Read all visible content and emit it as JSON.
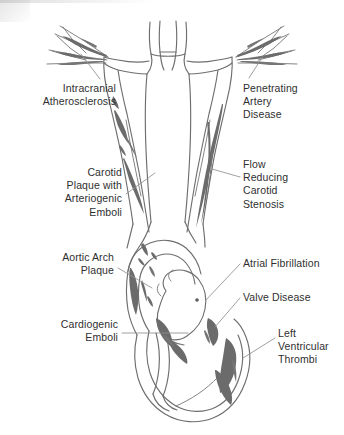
{
  "figure": {
    "background_color": "#ffffff",
    "outline_color": "#6e6e6e",
    "shading_color": "#6b6b6b",
    "leader_line_color": "#8a8a8a",
    "text_color": "#2f2f2f",
    "width": 344,
    "height": 435
  },
  "labels": [
    {
      "id": "intracranial-atherosclerosis",
      "text": "Intracranial\nAtherosclerosis",
      "align": "right",
      "x": 14,
      "y": 82,
      "width": 102
    },
    {
      "id": "penetrating-artery-disease",
      "text": "Penetrating\nArtery\nDisease",
      "align": "left",
      "x": 243,
      "y": 82,
      "width": 96
    },
    {
      "id": "carotid-plaque-with-arteriogenic-emboli",
      "text": "Carotid\nPlaque with\nArteriogenic\nEmboli",
      "align": "right",
      "x": 22,
      "y": 166,
      "width": 100
    },
    {
      "id": "flow-reducing-carotid-stenosis",
      "text": "Flow\nReducing\nCarotid\nStenosis",
      "align": "left",
      "x": 243,
      "y": 158,
      "width": 96
    },
    {
      "id": "aortic-arch-plaque",
      "text": "Aortic Arch\nPlaque",
      "align": "right",
      "x": 22,
      "y": 251,
      "width": 92
    },
    {
      "id": "atrial-fibrillation",
      "text": "Atrial Fibrillation",
      "align": "left",
      "x": 243,
      "y": 257,
      "width": 100
    },
    {
      "id": "valve-disease",
      "text": "Valve Disease",
      "align": "left",
      "x": 243,
      "y": 291,
      "width": 100
    },
    {
      "id": "cardiogenic-emboli",
      "text": "Cardiogenic\nEmboli",
      "align": "right",
      "x": 22,
      "y": 318,
      "width": 96
    },
    {
      "id": "left-ventricular-thrombi",
      "text": "Left\nVentricular\nThrombi",
      "align": "left",
      "x": 278,
      "y": 327,
      "width": 66
    }
  ],
  "leader_lines": [
    {
      "id": "leader-intracranial",
      "x1": 100,
      "y1": 79,
      "x2": 81,
      "y2": 54
    },
    {
      "id": "leader-penetrating",
      "x1": 249,
      "y1": 78,
      "x2": 263,
      "y2": 56
    },
    {
      "id": "leader-carotid-plaque",
      "x1": 126,
      "y1": 194,
      "x2": 155,
      "y2": 173
    },
    {
      "id": "leader-flow-reducing",
      "x1": 240,
      "y1": 177,
      "x2": 212,
      "y2": 169
    },
    {
      "id": "leader-aortic-arch",
      "x1": 118,
      "y1": 268,
      "x2": 152,
      "y2": 288
    },
    {
      "id": "leader-atrial-fib",
      "x1": 240,
      "y1": 264,
      "x2": 206,
      "y2": 300
    },
    {
      "id": "leader-valve",
      "x1": 240,
      "y1": 298,
      "x2": 215,
      "y2": 327
    },
    {
      "id": "leader-cardiogenic",
      "x1": 122,
      "y1": 333,
      "x2": 188,
      "y2": 333
    },
    {
      "id": "leader-lv-thrombi",
      "x1": 275,
      "y1": 338,
      "x2": 243,
      "y2": 358
    }
  ],
  "anatomy": {
    "regions": [
      "cerebral-arterial-branches",
      "circle-of-willis",
      "internal-carotid-arteries",
      "aortic-arch",
      "left-atrium",
      "mitral-valve",
      "left-ventricle",
      "cardiac-apex"
    ]
  }
}
